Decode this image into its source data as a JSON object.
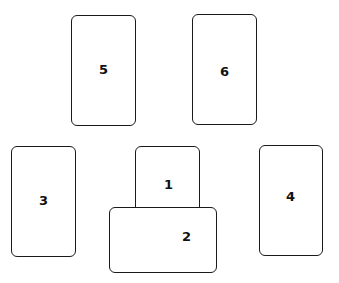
{
  "diagram": {
    "type": "card-spread-layout",
    "cards": [
      {
        "id": "5",
        "label": "5"
      },
      {
        "id": "6",
        "label": "6"
      },
      {
        "id": "3",
        "label": "3"
      },
      {
        "id": "1",
        "label": "1"
      },
      {
        "id": "2",
        "label": "2"
      },
      {
        "id": "4",
        "label": "4"
      }
    ]
  },
  "colors": {
    "stroke": "#1a1a1a",
    "fill": "#ffffff",
    "text": "#111111"
  }
}
